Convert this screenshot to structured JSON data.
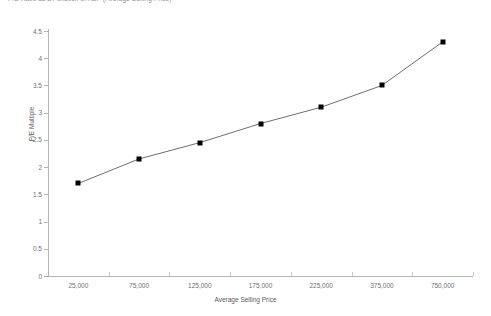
{
  "chart_data": {
    "type": "line",
    "title": "P/E Ratio as a Function of ASP (Average Selling Price)",
    "xlabel": "Average Selling Price",
    "ylabel": "P/E Multiple",
    "categories": [
      "25,000",
      "75,000",
      "125,000",
      "175,000",
      "225,000",
      "375,000",
      "750,000"
    ],
    "values": [
      1.7,
      2.15,
      2.45,
      2.8,
      3.1,
      3.5,
      4.3
    ],
    "series": [
      {
        "name": "P/E Multiple",
        "values": [
          1.7,
          2.15,
          2.45,
          2.8,
          3.1,
          3.5,
          4.3
        ]
      }
    ],
    "ylim": [
      0,
      4.5
    ],
    "yticks": [
      "0",
      "0.5",
      "1",
      "1.5",
      "2",
      "2.5",
      "3",
      "3.5",
      "4",
      "4.5"
    ],
    "ytick_values": [
      0,
      0.5,
      1,
      1.5,
      2,
      2.5,
      3,
      3.5,
      4,
      4.5
    ],
    "grid": false,
    "legend": "none",
    "marker": "square",
    "line_color": "#6e6e6e",
    "marker_color": "#000000",
    "axis_color": "#b4b4b4",
    "background": "#ffffff"
  }
}
